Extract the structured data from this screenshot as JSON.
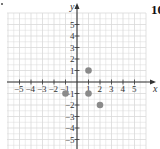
{
  "problem_number": "10",
  "chart_data": {
    "type": "scatter",
    "title": "",
    "xlabel": "x",
    "ylabel": "y",
    "xlim": [
      -6,
      6
    ],
    "ylim": [
      -6,
      6
    ],
    "grid": true,
    "x_ticks": [
      -5,
      -4,
      -3,
      -2,
      -1,
      1,
      2,
      3,
      4,
      5
    ],
    "y_ticks": [
      -5,
      -4,
      -3,
      -2,
      -1,
      1,
      2,
      3,
      4,
      5
    ],
    "points": [
      {
        "x": 1,
        "y": 1
      },
      {
        "x": -1,
        "y": -1
      },
      {
        "x": 1,
        "y": -1
      },
      {
        "x": 2,
        "y": -2
      }
    ],
    "point_color": "#8a8a8a",
    "grid_color": "#d9d9d9",
    "axis_color": "#333333"
  }
}
